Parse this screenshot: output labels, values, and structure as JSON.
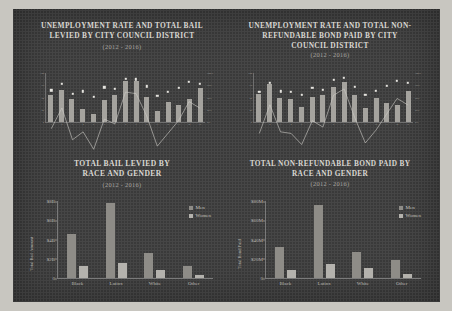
{
  "poster": {
    "background_color": "#3a3a3a",
    "border_color": "#c8c6c0"
  },
  "panels": {
    "top_left": {
      "title_line1": "Unemployment Rate and Total Bail",
      "title_line2": "Levied by City Council District",
      "subtitle": "(2012 - 2016)"
    },
    "top_right": {
      "title_line1": "Unemployment Rate and Total Non-",
      "title_line2": "Refundable Bond Paid by City",
      "title_line3": "Council District",
      "subtitle": "(2012 - 2016)"
    },
    "bottom_left": {
      "title_line1": "Total Bail Levied by",
      "title_line2": "Race and Gender",
      "subtitle": "(2012 - 2016)"
    },
    "bottom_right": {
      "title_line1": "Total Non-Refundable Bond Paid by",
      "title_line2": "Race and Gender",
      "subtitle": "(2012 - 2016)"
    }
  },
  "legend": {
    "men_label": "Men",
    "women_label": "Women",
    "men_color": "#8e8c87",
    "women_color": "#b4b2ad"
  },
  "chart_data": [
    {
      "id": "unemployment-bail-by-district",
      "type": "bar",
      "title": "Unemployment Rate and Total Bail Levied by City Council District",
      "subtitle": "(2012 - 2016)",
      "xlabel": "",
      "ylabel": "Total Bail Levied",
      "y2label": "Unemployment Rate",
      "grid": false,
      "legend_position": "none",
      "categories": [
        "1",
        "2",
        "3",
        "4",
        "5",
        "6",
        "7",
        "8",
        "9",
        "10",
        "11",
        "12",
        "13",
        "14",
        "15"
      ],
      "ylim": [
        0,
        100
      ],
      "y2lim": [
        0,
        100
      ],
      "series": [
        {
          "name": "Total Bail Levied",
          "type": "bar",
          "values": [
            55,
            66,
            47,
            27,
            16,
            44,
            56,
            84,
            84,
            52,
            22,
            40,
            34,
            46,
            69
          ]
        },
        {
          "name": "Unemployment Rate",
          "type": "line",
          "values": [
            65,
            78,
            58,
            63,
            52,
            71,
            68,
            88,
            87,
            73,
            54,
            62,
            70,
            82,
            78
          ]
        }
      ]
    },
    {
      "id": "unemployment-bond-by-district",
      "type": "bar",
      "title": "Unemployment Rate and Total Non-Refundable Bond Paid by City Council District",
      "subtitle": "(2012 - 2016)",
      "xlabel": "",
      "ylabel": "Total Bond Paid",
      "y2label": "Unemployment Rate",
      "grid": false,
      "legend_position": "none",
      "categories": [
        "1",
        "2",
        "3",
        "4",
        "5",
        "6",
        "7",
        "8",
        "9",
        "10",
        "11",
        "12",
        "13",
        "14",
        "15"
      ],
      "ylim": [
        0,
        100
      ],
      "y2lim": [
        0,
        100
      ],
      "series": [
        {
          "name": "Total Bond Paid",
          "type": "bar",
          "values": [
            58,
            77,
            50,
            47,
            30,
            52,
            56,
            72,
            82,
            55,
            28,
            49,
            38,
            34,
            63
          ]
        },
        {
          "name": "Unemployment Rate",
          "type": "line",
          "values": [
            62,
            80,
            63,
            62,
            55,
            70,
            66,
            86,
            90,
            72,
            56,
            64,
            74,
            84,
            80
          ]
        }
      ]
    },
    {
      "id": "total-bail-by-race-gender",
      "type": "bar",
      "title": "Total Bail Levied by Race and Gender",
      "subtitle": "(2012 - 2016)",
      "xlabel": "",
      "ylabel": "Total Bail Amount",
      "grid": false,
      "legend_position": "top-right",
      "categories": [
        "Black",
        "Latinx",
        "White",
        "Other"
      ],
      "ylim": [
        0,
        8
      ],
      "ytick_labels": [
        "$8B",
        "$6B",
        "$4B",
        "$2B",
        "0"
      ],
      "ytick_values": [
        8,
        6,
        4,
        2,
        0
      ],
      "series": [
        {
          "name": "Men",
          "values": [
            4.6,
            7.8,
            2.6,
            1.3
          ]
        },
        {
          "name": "Women",
          "values": [
            1.3,
            1.6,
            0.8,
            0.3
          ]
        }
      ]
    },
    {
      "id": "total-bond-by-race-gender",
      "type": "bar",
      "title": "Total Non-Refundable Bond Paid by Race and Gender",
      "subtitle": "(2012 - 2016)",
      "xlabel": "",
      "ylabel": "Total Bond Paid",
      "grid": false,
      "legend_position": "top-right",
      "categories": [
        "Black",
        "Latinx",
        "White",
        "Other"
      ],
      "ylim": [
        0,
        80
      ],
      "ytick_labels": [
        "$80M",
        "$60M",
        "$40M",
        "$20M",
        "0"
      ],
      "ytick_values": [
        80,
        60,
        40,
        20,
        0
      ],
      "series": [
        {
          "name": "Men",
          "values": [
            32,
            76,
            27,
            19
          ]
        },
        {
          "name": "Women",
          "values": [
            8,
            15,
            10,
            4
          ]
        }
      ]
    }
  ]
}
